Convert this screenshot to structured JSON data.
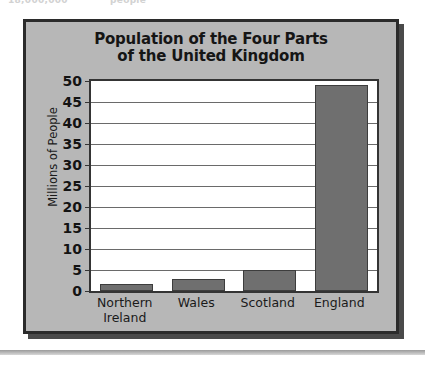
{
  "page": {
    "clipped_top_text_left": "18,000,000",
    "clipped_top_text_right": "people"
  },
  "chart_data": {
    "type": "bar",
    "title": "Population of the Four Parts of the United Kingdom",
    "title_line1": "Population of the Four Parts",
    "title_line2": "of the United Kingdom",
    "xlabel": "",
    "ylabel": "Millions of People",
    "categories": [
      "Northern Ireland",
      "Wales",
      "Scotland",
      "England"
    ],
    "category_lines": [
      [
        "Northern",
        "Ireland"
      ],
      [
        "Wales"
      ],
      [
        "Scotland"
      ],
      [
        "England"
      ]
    ],
    "values": [
      1.7,
      2.9,
      5.1,
      49.1
    ],
    "ylim": [
      0,
      50
    ],
    "ytick_step": 5,
    "ytick_labels": [
      "50",
      "45",
      "40",
      "35",
      "30",
      "25",
      "20",
      "15",
      "10",
      "5",
      "0"
    ],
    "ytick_values": [
      50,
      45,
      40,
      35,
      30,
      25,
      20,
      15,
      10,
      5,
      0
    ],
    "grid": true,
    "legend": false,
    "bar_color": "#6f6f6f",
    "bar_border_color": "#3d3d3d",
    "plot_background": "#ffffff",
    "panel_background": "#b7b7b7",
    "frame_color": "#2b2b2b",
    "text_color": "#151515"
  }
}
